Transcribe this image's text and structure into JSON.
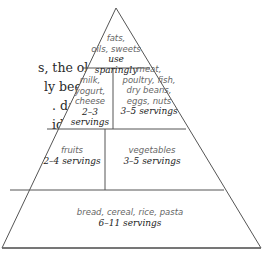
{
  "body_text": {
    "lines": [
      "s, the old",
      "ly been",
      ". daily",
      "idea",
      "o-",
      "n"
    ]
  },
  "pyramid": {
    "tiers": [
      {
        "name": "fats",
        "label_lines": [
          "fats,",
          "oils, sweets"
        ],
        "servings": "use sparingly"
      },
      {
        "name": "milk",
        "label_lines": [
          "milk,",
          "yogurt,",
          "cheese"
        ],
        "servings": "2–3 servings"
      },
      {
        "name": "meat",
        "label_lines": [
          "meat,",
          "poultry, fish,",
          "dry beans,",
          "eggs, nuts"
        ],
        "servings": "3–5 servings"
      },
      {
        "name": "fruits",
        "label_lines": [
          "fruits"
        ],
        "servings": "2–4 servings"
      },
      {
        "name": "vegetables",
        "label_lines": [
          "vegetables"
        ],
        "servings": "3–5 servings"
      },
      {
        "name": "grains",
        "label_lines": [
          "bread, cereal, rice, pasta"
        ],
        "servings": "6–11 servings"
      }
    ]
  }
}
